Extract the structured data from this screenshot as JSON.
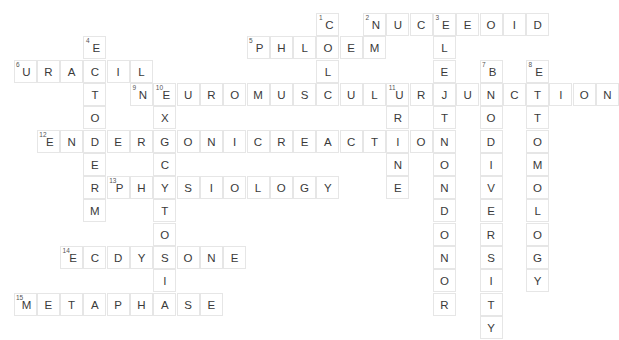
{
  "puzzle": {
    "title": "Biology Crossword Grid",
    "cell_size": 23.3,
    "origin_x": 13.5,
    "origin_y": 13.0,
    "colors": {
      "background": "#ffffff",
      "cell_border": "#e6e6e6",
      "letter": "#3a3a3a",
      "number": "#555555"
    },
    "entries": [
      {
        "number": 1,
        "direction": "down",
        "answer": "CELL",
        "row": 0,
        "col": 13
      },
      {
        "number": 2,
        "direction": "across",
        "answer": "NUCLEOID",
        "row": 0,
        "col": 15
      },
      {
        "number": 3,
        "direction": "down",
        "answer": "ELECTRONDONOR",
        "row": 0,
        "col": 18
      },
      {
        "number": 4,
        "direction": "down",
        "answer": "ECTODERM",
        "row": 1,
        "col": 3
      },
      {
        "number": 5,
        "direction": "across",
        "answer": "PHLOEM",
        "row": 1,
        "col": 10
      },
      {
        "number": 6,
        "direction": "across",
        "answer": "URACIL",
        "row": 2,
        "col": 0
      },
      {
        "number": 7,
        "direction": "down",
        "answer": "BIODIVERSITY",
        "row": 2,
        "col": 20
      },
      {
        "number": 8,
        "direction": "down",
        "answer": "ENTOMOLOGY",
        "row": 2,
        "col": 22
      },
      {
        "number": 9,
        "direction": "across",
        "answer": "NEUROMUSCULARJUNCTION",
        "row": 3,
        "col": 5
      },
      {
        "number": 10,
        "direction": "down",
        "answer": "EXOCYTOSIS",
        "row": 3,
        "col": 6
      },
      {
        "number": 11,
        "direction": "down",
        "answer": "URINE",
        "row": 3,
        "col": 16
      },
      {
        "number": 12,
        "direction": "across",
        "answer": "ENDERGONICREACTION",
        "row": 5,
        "col": 1
      },
      {
        "number": 13,
        "direction": "across",
        "answer": "PHYSIOLOGY",
        "row": 7,
        "col": 4
      },
      {
        "number": 14,
        "direction": "across",
        "answer": "ECDYSONE",
        "row": 10,
        "col": 2
      },
      {
        "number": 15,
        "direction": "across",
        "answer": "METAPHASE",
        "row": 12,
        "col": 0
      }
    ]
  }
}
